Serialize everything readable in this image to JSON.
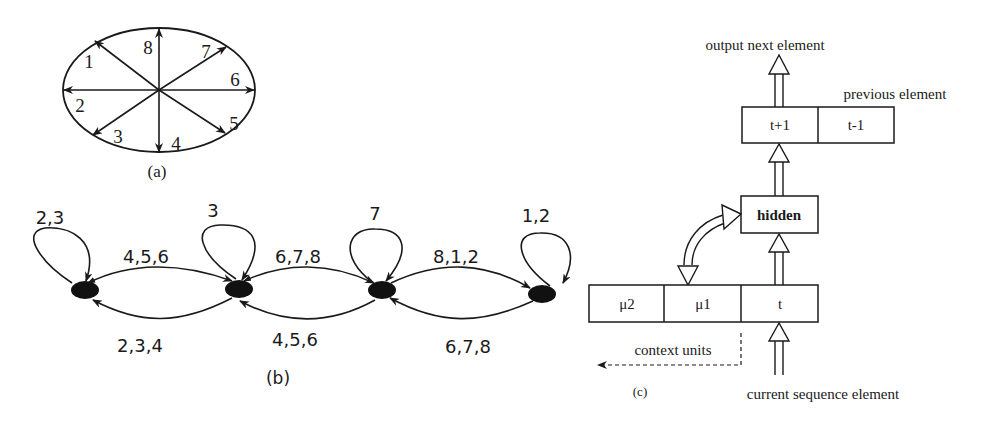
{
  "panel_a": {
    "caption": "(a)",
    "directions": [
      {
        "label": "1",
        "angle_deg": 135
      },
      {
        "label": "2",
        "angle_deg": 180
      },
      {
        "label": "3",
        "angle_deg": 225
      },
      {
        "label": "4",
        "angle_deg": 270
      },
      {
        "label": "5",
        "angle_deg": 315
      },
      {
        "label": "6",
        "angle_deg": 0
      },
      {
        "label": "7",
        "angle_deg": 45
      },
      {
        "label": "8",
        "angle_deg": 90
      }
    ]
  },
  "panel_b": {
    "caption": "(b)",
    "states": [
      {
        "id": "s1",
        "self_loop_label": "2,3"
      },
      {
        "id": "s2",
        "self_loop_label": "3"
      },
      {
        "id": "s3",
        "self_loop_label": "7"
      },
      {
        "id": "s4",
        "self_loop_label": "1,2"
      }
    ],
    "forward_edges": [
      {
        "from": "s1",
        "to": "s2",
        "label": "4,5,6"
      },
      {
        "from": "s2",
        "to": "s3",
        "label": "6,7,8"
      },
      {
        "from": "s3",
        "to": "s4",
        "label": "8,1,2"
      }
    ],
    "backward_edges": [
      {
        "from": "s2",
        "to": "s1",
        "label": "2,3,4"
      },
      {
        "from": "s3",
        "to": "s2",
        "label": "4,5,6"
      },
      {
        "from": "s4",
        "to": "s3",
        "label": "6,7,8"
      }
    ]
  },
  "panel_c": {
    "caption": "(c)",
    "output_label": "output next element",
    "previous_label": "previous element",
    "output_layer": {
      "left": "t+1",
      "right": "t-1"
    },
    "hidden_label": "hidden",
    "input_layer": {
      "cells": [
        "μ2",
        "μ1",
        "t"
      ]
    },
    "context_label": "context units",
    "input_label": "current sequence element"
  }
}
